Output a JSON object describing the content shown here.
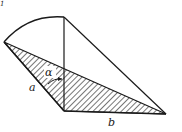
{
  "diagram": {
    "corner_mark": "1",
    "labels": {
      "angle": "α",
      "side_a": "a",
      "side_b": "b"
    },
    "colors": {
      "stroke": "#1a1a1a",
      "background": "#ffffff"
    }
  }
}
